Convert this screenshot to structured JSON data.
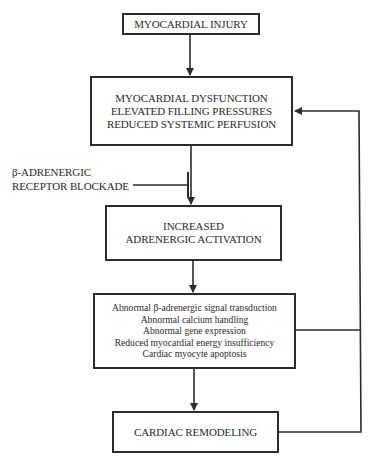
{
  "diagram": {
    "nodes": {
      "injury": {
        "lines": [
          "MYOCARDIAL INJURY"
        ]
      },
      "dysfunction": {
        "lines": [
          "MYOCARDIAL DYSFUNCTION",
          "ELEVATED FILLING PRESSURES",
          "REDUCED SYSTEMIC PERFUSION"
        ]
      },
      "activation": {
        "lines": [
          "INCREASED",
          "ADRENERGIC ACTIVATION"
        ]
      },
      "mechanisms": {
        "lines": [
          "Abnormal β-adrenergic signal transduction",
          "Abnormal calcium handling",
          "Abnormal  gene expression",
          "Reduced  myocardial energy insufficiency",
          "Cardiac myocyte apoptosis"
        ]
      },
      "remodeling": {
        "lines": [
          "CARDIAC REMODELING"
        ]
      }
    },
    "inhibitor": {
      "lines": [
        "β-ADRENERGIC",
        "RECEPTOR BLOCKADE"
      ]
    },
    "edges": [
      {
        "from": "injury",
        "to": "dysfunction",
        "type": "arrow"
      },
      {
        "from": "dysfunction",
        "to": "activation",
        "type": "arrow"
      },
      {
        "from": "inhibitor",
        "to": "dysfunction-activation-edge",
        "type": "inhibition"
      },
      {
        "from": "activation",
        "to": "mechanisms",
        "type": "arrow"
      },
      {
        "from": "mechanisms",
        "to": "remodeling",
        "type": "arrow"
      },
      {
        "from": "mechanisms",
        "to": "dysfunction",
        "type": "feedback-arrow"
      },
      {
        "from": "remodeling",
        "to": "dysfunction",
        "type": "feedback-arrow"
      }
    ],
    "colors": {
      "stroke": "#2b2b2b",
      "background": "#ffffff"
    }
  }
}
